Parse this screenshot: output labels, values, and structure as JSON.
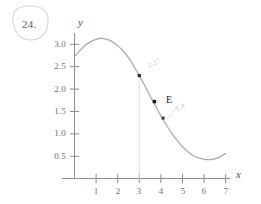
{
  "figure": {
    "problem_number": "24.",
    "point_label": "E",
    "annotations": [
      {
        "name": "upper-pencil-note",
        "text": "2.27"
      },
      {
        "name": "lower-pencil-note",
        "text": "1.4"
      }
    ]
  },
  "chart_data": {
    "type": "line",
    "title": "",
    "xlabel": "x",
    "ylabel": "y",
    "xlim": [
      0,
      7.4
    ],
    "ylim": [
      0,
      3.35
    ],
    "grid": false,
    "legend": false,
    "x_ticks": [
      1,
      2,
      3,
      4,
      5,
      6,
      7
    ],
    "x_tick_labels": [
      "1",
      "2",
      "3",
      "4",
      "5",
      "6",
      "7"
    ],
    "y_ticks": [
      0.5,
      1.0,
      1.5,
      2.0,
      2.5,
      3.0
    ],
    "y_tick_labels": [
      "0.5",
      "1.0",
      "1.5",
      "2.0",
      "2.5",
      "3.0"
    ],
    "series": [
      {
        "name": "curve",
        "color": "#a9a9a9",
        "x": [
          0.0,
          0.25,
          0.5,
          0.75,
          1.0,
          1.25,
          1.5,
          1.75,
          2.0,
          2.25,
          2.5,
          2.75,
          3.0,
          3.25,
          3.5,
          3.75,
          4.0,
          4.25,
          4.5,
          4.75,
          5.0,
          5.25,
          5.5,
          5.75,
          6.0,
          6.25,
          6.5,
          6.75,
          7.0
        ],
        "y": [
          2.72,
          2.86,
          2.98,
          3.06,
          3.11,
          3.13,
          3.11,
          3.06,
          2.97,
          2.85,
          2.7,
          2.51,
          2.3,
          2.08,
          1.85,
          1.62,
          1.4,
          1.2,
          1.01,
          0.85,
          0.71,
          0.6,
          0.51,
          0.46,
          0.43,
          0.42,
          0.44,
          0.49,
          0.56
        ]
      }
    ],
    "points": [
      {
        "name": "point-upper",
        "x": 3.0,
        "y": 2.3,
        "label": ""
      },
      {
        "name": "point-e",
        "x": 3.7,
        "y": 1.72,
        "label": "E"
      },
      {
        "name": "point-lower",
        "x": 4.1,
        "y": 1.35,
        "label": ""
      }
    ],
    "reference_lines": [
      {
        "name": "vertical-line-x3",
        "orientation": "vertical",
        "value": 3.0
      }
    ]
  }
}
